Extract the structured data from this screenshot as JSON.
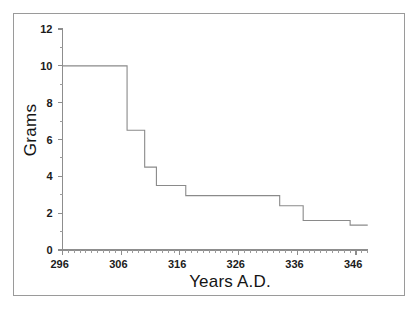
{
  "chart_data": {
    "type": "line",
    "subtype": "step",
    "title": "",
    "xlabel": "Years A.D.",
    "ylabel": "Grams",
    "xlim": [
      296,
      348
    ],
    "ylim": [
      0,
      12
    ],
    "grid": false,
    "legend": null,
    "x_tick_labels": [
      "296",
      "306",
      "316",
      "326",
      "336",
      "346"
    ],
    "x_tick_values": [
      296,
      306,
      316,
      326,
      336,
      346
    ],
    "x_minor_tick_interval": 1,
    "y_tick_labels": [
      "0",
      "2",
      "4",
      "6",
      "8",
      "10",
      "12"
    ],
    "y_tick_values": [
      0,
      2,
      4,
      6,
      8,
      10,
      12
    ],
    "y_minor_tick_interval": 1,
    "line_color": "#8a8a8a",
    "axis_color": "#8d8d8d",
    "steps": [
      {
        "x_start": 296,
        "x_end": 307,
        "y": 10.0
      },
      {
        "x_start": 307,
        "x_end": 310,
        "y": 6.5
      },
      {
        "x_start": 310,
        "x_end": 312,
        "y": 4.5
      },
      {
        "x_start": 312,
        "x_end": 317,
        "y": 3.5
      },
      {
        "x_start": 317,
        "x_end": 333,
        "y": 2.95
      },
      {
        "x_start": 333,
        "x_end": 337,
        "y": 2.4
      },
      {
        "x_start": 337,
        "x_end": 345,
        "y": 1.6
      },
      {
        "x_start": 345,
        "x_end": 348,
        "y": 1.35
      }
    ],
    "x": [
      296,
      307,
      307,
      310,
      310,
      312,
      312,
      317,
      317,
      333,
      333,
      337,
      337,
      345,
      345,
      348
    ],
    "y": [
      10.0,
      10.0,
      6.5,
      6.5,
      4.5,
      4.5,
      3.5,
      3.5,
      2.95,
      2.95,
      2.4,
      2.4,
      1.6,
      1.6,
      1.35,
      1.35
    ]
  },
  "axes": {
    "x_title": "Years A.D.",
    "y_title": "Grams"
  }
}
